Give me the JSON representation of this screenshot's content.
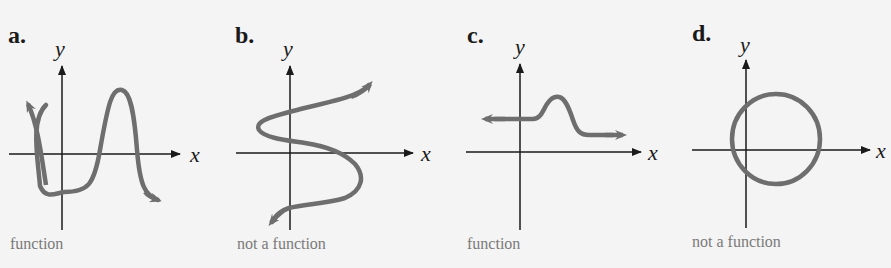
{
  "colors": {
    "curve": "#6e6e6e",
    "axis": "#1a1a1a",
    "caption": "#7a7a7a",
    "background": "#f4f4f4"
  },
  "panels": [
    {
      "label": "a.",
      "x_axis": "x",
      "y_axis": "y",
      "caption": "function",
      "shape": "wavy curve passing vertical line test"
    },
    {
      "label": "b.",
      "x_axis": "x",
      "y_axis": "y",
      "caption": "not a function",
      "shape": "sideways S-curve"
    },
    {
      "label": "c.",
      "x_axis": "x",
      "y_axis": "y",
      "caption": "function",
      "shape": "horizontal curve with a bump"
    },
    {
      "label": "d.",
      "x_axis": "x",
      "y_axis": "y",
      "caption": "not a function",
      "shape": "circle"
    }
  ]
}
